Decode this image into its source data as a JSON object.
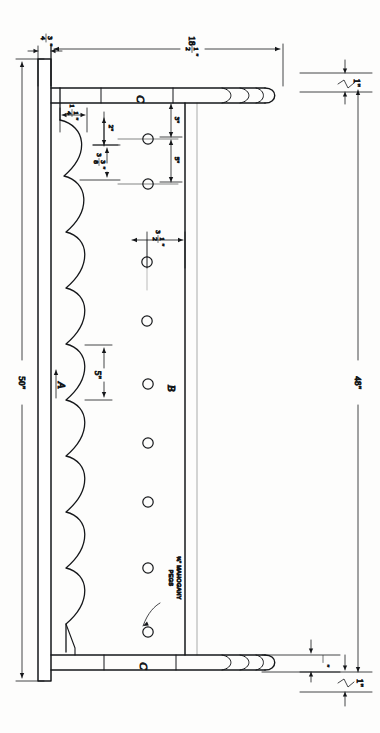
{
  "drawing": {
    "title": "Scalloped Peg Rail Shop Drawing",
    "orientation": "rotated-90",
    "ink_color": "#15171a",
    "paper_color": "#fdfdfc",
    "part_labels": [
      {
        "id": "A",
        "text": "A",
        "note": "scalloped side rail / stile"
      },
      {
        "id": "B",
        "text": "B",
        "note": "peg board panel"
      },
      {
        "id": "C_top",
        "text": "C",
        "note": "top rail"
      },
      {
        "id": "C_bottom",
        "text": "C",
        "note": "bottom rail"
      }
    ],
    "dimensions": {
      "stile_thickness": {
        "whole": "3",
        "frac_num": "3",
        "frac_den": "4",
        "text": "3/4\"",
        "display": "¾\""
      },
      "overall_width": {
        "whole": "18",
        "frac_num": "1",
        "frac_den": "2",
        "text": "18 1/2\"",
        "display": "18½\""
      },
      "overall_height_outer": {
        "text": "50\""
      },
      "overall_height_inner": {
        "text": "48\""
      },
      "rail_thickness_top": {
        "text": "1\""
      },
      "rail_thickness_bottom": {
        "text": "1\""
      },
      "rail_offset_bottom": {
        "text": "3/4\"",
        "display": "¾\""
      },
      "scallop_offset_1": {
        "text": "1 1/4\"",
        "display": "1¼\""
      },
      "scallop_offset_2": {
        "text": "2\""
      },
      "scallop_radius": {
        "text": "3 3/8\"",
        "display": "3⅜\""
      },
      "peg_edge_offset": {
        "text": "3\""
      },
      "peg_spacing": {
        "text": "5\""
      },
      "peg_inset_from_edge": {
        "text": "3 1/2\"",
        "display": "3½\""
      },
      "scallop_pitch": {
        "text": "5\""
      }
    },
    "notes": [
      {
        "line1": "3/4\" MAHOGANY",
        "line2": "PEGS",
        "display1": "¾\" MAHOGANY",
        "display2": "PEGS"
      }
    ],
    "peg_count": 9,
    "scallop_count": 9,
    "peg_hole_diameter_px": 9
  }
}
